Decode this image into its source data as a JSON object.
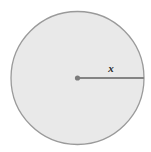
{
  "figure": {
    "kind": "geometry-diagram",
    "background_color": "#ffffff",
    "width": 151,
    "height": 152
  },
  "circle": {
    "name": "circle",
    "center_x": 77.5,
    "center_y": 78,
    "radius": 66.5,
    "fill_color": "#e9e9e9",
    "stroke_color": "#9a9a9a",
    "stroke_width": 1.3
  },
  "center_point": {
    "name": "center-dot",
    "x": 77.5,
    "y": 78,
    "radius": 2.6,
    "color": "#7c7c7c"
  },
  "radius_segment": {
    "name": "radius-line",
    "x1": 77.5,
    "y1": 78,
    "x2": 144,
    "y2": 78,
    "color": "#848484",
    "stroke_width": 2.1,
    "label": "x",
    "label_color": "#2b2b2b"
  }
}
